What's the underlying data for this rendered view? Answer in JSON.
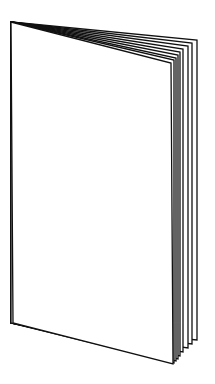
{
  "illustration": {
    "subject": "open booklet line drawing",
    "stroke_color": "#111111",
    "background_color": "#ffffff",
    "page_fill": "#ffffff",
    "page_count_visible": 8
  }
}
